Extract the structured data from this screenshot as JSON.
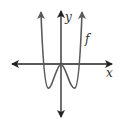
{
  "diagram": {
    "type": "function-graph",
    "curve_label": "f",
    "x_axis_label": "x",
    "y_axis_label": "y",
    "colors": {
      "axes": "#222222",
      "curve": "#5a5a5a",
      "background": "#ffffff"
    }
  }
}
